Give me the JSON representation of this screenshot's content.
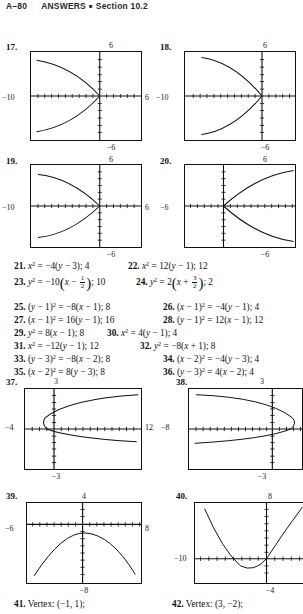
{
  "header": {
    "page_number": "A–80",
    "title": "ANSWERS",
    "separator": "■",
    "section": "Section 10.2"
  },
  "graphs": [
    {
      "number": "17.",
      "top_label": "6",
      "bottom_label": "−6",
      "left_label": "−10",
      "right_label": "6",
      "xmin": -10,
      "xmax": 6,
      "ymin": -6,
      "ymax": 6,
      "curve": "leftward-parabola",
      "description": "parabola opening left with vertex at origin"
    },
    {
      "number": "18.",
      "top_label": "6",
      "bottom_label": "−6",
      "left_label": "−10",
      "right_label": "6",
      "xmin": -10,
      "xmax": 6,
      "ymin": -6,
      "ymax": 6,
      "curve": "leftward-parabola",
      "description": "parabola opening left with vertex at origin"
    },
    {
      "number": "19.",
      "top_label": "6",
      "bottom_label": "−6",
      "left_label": "−10",
      "right_label": "6",
      "xmin": -10,
      "xmax": 6,
      "ymin": -6,
      "ymax": 6,
      "curve": "leftward-parabola",
      "description": "parabola opening left with vertex at origin"
    },
    {
      "number": "20.",
      "top_label": "6",
      "bottom_label": "−6",
      "left_label": "−6",
      "right_label": "10",
      "xmin": -6,
      "xmax": 10,
      "ymin": -6,
      "ymax": 6,
      "curve": "rightward-parabola",
      "description": "parabola opening right with vertex at origin"
    },
    {
      "number": "37.",
      "top_label": "3",
      "bottom_label": "−3",
      "left_label": "−4",
      "right_label": "12",
      "xmin": -4,
      "xmax": 12,
      "ymin": -3,
      "ymax": 3,
      "curve": "rightward-parabola-offset",
      "description": "parabola opening right with vertex near (-1, 1)"
    },
    {
      "number": "38.",
      "top_label": "3",
      "bottom_label": "−3",
      "left_label": "−8",
      "right_label": "8",
      "xmin": -8,
      "xmax": 8,
      "ymin": -3,
      "ymax": 3,
      "curve": "leftward-parabola-offset",
      "description": "parabola opening left with vertex near (3, 1)"
    },
    {
      "number": "39.",
      "top_label": "4",
      "bottom_label": "−8",
      "left_label": "−6",
      "right_label": "8",
      "xmin": -6,
      "xmax": 8,
      "ymin": -8,
      "ymax": 4,
      "curve": "downward-parabola",
      "description": "parabola opening downward with vertex near (1, -1)"
    },
    {
      "number": "40.",
      "top_label": "8",
      "bottom_label": "−4",
      "left_label": "−10",
      "right_label": "",
      "xmin": -10,
      "xmax": 4,
      "ymin": -4,
      "ymax": 8,
      "curve": "upward-parabola",
      "description": "parabola opening upward with vertex near (-2, -1)"
    }
  ],
  "answers": {
    "row1": [
      {
        "num": "21.",
        "body": "x² = −4(y − 3); 4"
      },
      {
        "num": "22.",
        "body": "x² = 12(y − 1); 12"
      }
    ],
    "row2": [
      {
        "num": "23.",
        "body": "y² = −10(x − 1/2); 10"
      },
      {
        "num": "24.",
        "body": "y² = 2(x + 3/2); 2"
      }
    ],
    "row3": [
      {
        "num": "25.",
        "body": "(y − 1)² = −8(x − 1); 8"
      },
      {
        "num": "26.",
        "body": "(x − 1)² = −4(y − 1); 4"
      }
    ],
    "row4": [
      {
        "num": "27.",
        "body": "(x − 1)² = 16(y − 1); 16"
      },
      {
        "num": "28.",
        "body": "(y − 1)² = 12(x − 1); 12"
      }
    ],
    "row5": [
      {
        "num": "29.",
        "body": "y² = 8(x − 1); 8"
      },
      {
        "num": "30.",
        "body": "x² = 4(y − 1); 4"
      }
    ],
    "row6": [
      {
        "num": "31.",
        "body": "x² = −12(y − 1); 12"
      },
      {
        "num": "32.",
        "body": "y² = −8(x + 1); 8"
      }
    ],
    "row7": [
      {
        "num": "33.",
        "body": "(y − 3)² = −8(x − 2); 8"
      },
      {
        "num": "34.",
        "body": "(x − 2)² = −4(y − 3); 4"
      }
    ],
    "row8": [
      {
        "num": "35.",
        "body": "(x − 2)² = 8(y − 3); 8"
      },
      {
        "num": "36.",
        "body": "(y − 3)² = 4(x − 2); 4"
      }
    ]
  },
  "vertex_line": {
    "left": {
      "num": "41.",
      "label": "Vertex:",
      "value": "(−1, 1);"
    },
    "right": {
      "num": "42.",
      "label": "Vertex:",
      "value": "(3, −2);"
    }
  }
}
